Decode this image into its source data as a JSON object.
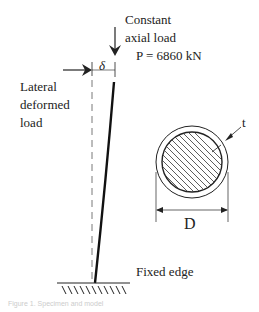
{
  "diagram": {
    "axial_load": {
      "line1": "Constant",
      "line2": "axial load",
      "value": "P = 6860 kN"
    },
    "lateral_load": {
      "line1": "Lateral",
      "line2": "deformed",
      "line3": "load"
    },
    "displacement_symbol": "δ",
    "support_label": "Fixed edge",
    "section": {
      "thickness_symbol": "t",
      "diameter_symbol": "D"
    },
    "caption": "Figure 1.  Specimen and model"
  }
}
